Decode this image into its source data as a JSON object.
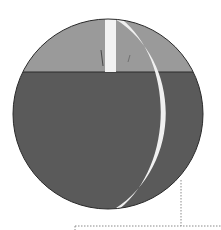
{
  "diagram": {
    "colors": {
      "background": "#ffffff",
      "cap": "#9a9a9a",
      "body": "#5a5a5a",
      "outline": "#2a2a2a",
      "strip": "#f2f2f2",
      "crescent": "#f0f0f0",
      "leader": "#8a8a8a"
    }
  }
}
